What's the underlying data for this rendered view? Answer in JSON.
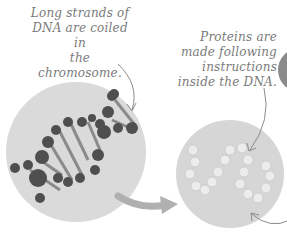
{
  "labels": {
    "dna_caption": [
      "Long strands of",
      "DNA are coiled in",
      "the chromosome."
    ],
    "protein_caption": [
      "Proteins are",
      "made following",
      "instructions",
      "inside the DNA."
    ]
  },
  "colors": {
    "circle_fill": "#d9d9d9",
    "text": "#7a7a7a",
    "dna_balls": "#4a4a4a",
    "arrow": "#b5b5b5",
    "protein_beads": "#eeeeee"
  }
}
